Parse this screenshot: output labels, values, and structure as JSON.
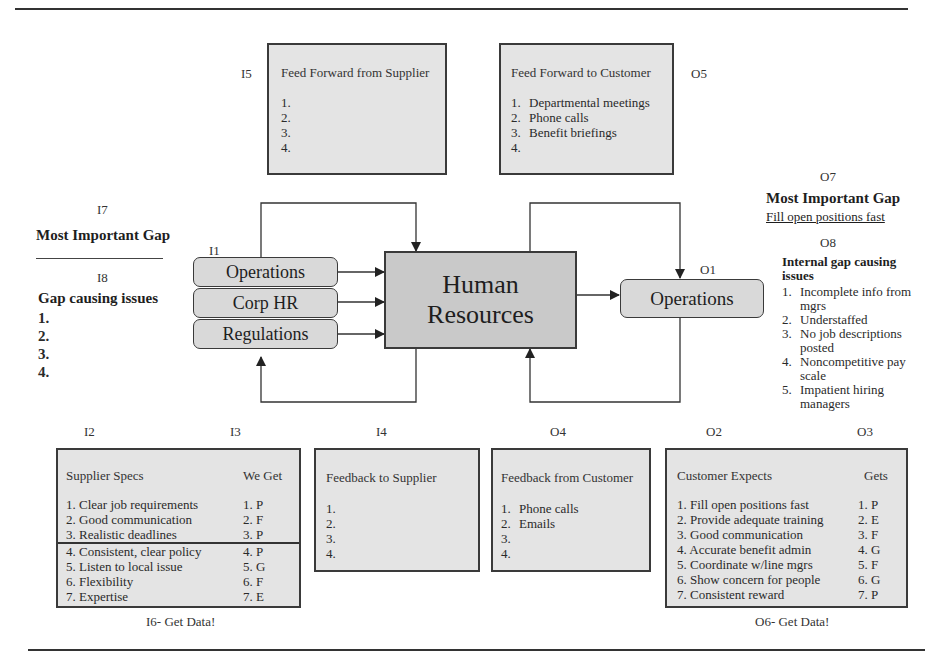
{
  "codes": {
    "I1": "I1",
    "I2": "I2",
    "I3": "I3",
    "I4": "I4",
    "I5": "I5",
    "I7": "I7",
    "I8": "I8",
    "O1": "O1",
    "O2": "O2",
    "O3": "O3",
    "O4": "O4",
    "O5": "O5",
    "O7": "O7",
    "O8": "O8"
  },
  "feed_forward_supplier": {
    "title": "Feed Forward from Supplier",
    "items": [
      "1.",
      "2.",
      "3.",
      "4."
    ]
  },
  "feed_forward_customer": {
    "title": "Feed Forward to Customer",
    "items": [
      {
        "n": "1.",
        "text": "Departmental meetings"
      },
      {
        "n": "2.",
        "text": "Phone calls"
      },
      {
        "n": "3.",
        "text": "Benefit briefings"
      },
      {
        "n": "4.",
        "text": ""
      }
    ]
  },
  "left_gap": {
    "heading": "Most Important Gap",
    "issues_heading": "Gap causing issues",
    "items": [
      "1.",
      "2.",
      "3.",
      "4."
    ]
  },
  "inputs": [
    "Operations",
    "Corp HR",
    "Regulations"
  ],
  "process": {
    "line1": "Human",
    "line2": "Resources"
  },
  "output": {
    "label": "Operations"
  },
  "right_gap": {
    "heading": "Most Important Gap",
    "gap_value": "Fill open positions fast",
    "issues_heading": "Internal gap causing issues",
    "items": [
      {
        "n": "1.",
        "text": "Incomplete info from mgrs"
      },
      {
        "n": "2.",
        "text": "Understaffed"
      },
      {
        "n": "3.",
        "text": "No job descriptions posted"
      },
      {
        "n": "4.",
        "text": "Noncompetitive pay scale"
      },
      {
        "n": "5.",
        "text": "Impatient hiring managers"
      }
    ]
  },
  "supplier_specs": {
    "col1": "Supplier Specs",
    "col2": "We Get",
    "rows": [
      {
        "spec": "1. Clear job requirements",
        "get": "1.  P"
      },
      {
        "spec": "2. Good communication",
        "get": "2.  F"
      },
      {
        "spec": "3. Realistic deadlines",
        "get": "3.  P"
      },
      {
        "spec": "4. Consistent, clear policy",
        "get": "4.  P"
      },
      {
        "spec": "5. Listen to local issue",
        "get": "5.  G"
      },
      {
        "spec": "6. Flexibility",
        "get": "6.  F"
      },
      {
        "spec": "7. Expertise",
        "get": "7.  E"
      }
    ],
    "footer": "I6- Get Data!"
  },
  "feedback_supplier": {
    "title": "Feedback to Supplier",
    "items": [
      "1.",
      "2.",
      "3.",
      "4."
    ]
  },
  "feedback_customer": {
    "title": "Feedback from Customer",
    "items": [
      {
        "n": "1.",
        "text": "Phone calls"
      },
      {
        "n": "2.",
        "text": "Emails"
      },
      {
        "n": "3.",
        "text": ""
      },
      {
        "n": "4.",
        "text": ""
      }
    ]
  },
  "customer_expects": {
    "col1": "Customer Expects",
    "col2": "Gets",
    "rows": [
      {
        "expect": "1.  Fill open positions fast",
        "get": "1.  P"
      },
      {
        "expect": "2.  Provide adequate training",
        "get": "2.  E"
      },
      {
        "expect": "3.  Good communication",
        "get": "3.  F"
      },
      {
        "expect": "4.  Accurate benefit admin",
        "get": "4.  G"
      },
      {
        "expect": "5.  Coordinate w/line mgrs",
        "get": "5.  F"
      },
      {
        "expect": "6.  Show concern for people",
        "get": "6.  G"
      },
      {
        "expect": "7.  Consistent reward",
        "get": "7.  P"
      }
    ],
    "footer": "O6- Get Data!"
  }
}
